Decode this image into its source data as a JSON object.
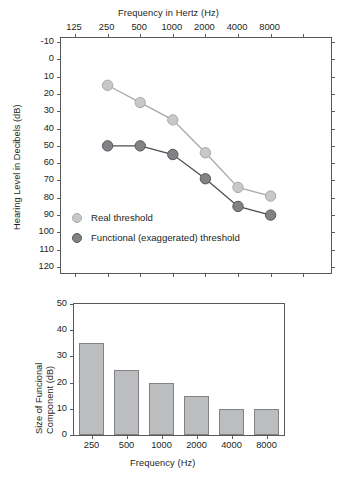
{
  "figure": {
    "panels": [
      "audiogram",
      "functional-component-bars"
    ]
  },
  "colors": {
    "real_threshold": "#c7c8ca",
    "functional_threshold": "#808285",
    "bar_fill": "#bcbdbf",
    "bar_stroke": "#808285",
    "axis": "#58595b",
    "text": "#231f20"
  },
  "audiogram": {
    "top_axis_title": "Frequency in Hertz (Hz)",
    "y_axis_title": "Hearing Level in Decibels (dB)",
    "x_tick_labels": [
      "125",
      "250",
      "500",
      "1000",
      "2000",
      "4000",
      "8000"
    ],
    "y_tick_labels": [
      "-10",
      "0",
      "10",
      "20",
      "30",
      "40",
      "50",
      "60",
      "70",
      "80",
      "90",
      "100",
      "110",
      "120"
    ],
    "legend": [
      {
        "label": "Real threshold",
        "marker": "light-gray-circle"
      },
      {
        "label": "Functional (exaggerated) threshold",
        "marker": "dark-gray-circle"
      }
    ]
  },
  "barchart": {
    "x_axis_title": "Frequency (Hz)",
    "y_axis_title_line1": "Size of Funcional",
    "y_axis_title_line2": "Component (dB)",
    "x_tick_labels": [
      "250",
      "500",
      "1000",
      "2000",
      "4000",
      "8000"
    ],
    "y_tick_labels": [
      "0",
      "10",
      "20",
      "30",
      "40",
      "50"
    ]
  },
  "chart_data": [
    {
      "type": "line",
      "title": "",
      "xlabel": "Frequency in Hertz (Hz)",
      "ylabel": "Hearing Level in Decibels (dB)",
      "x": [
        250,
        500,
        1000,
        2000,
        4000,
        8000
      ],
      "xtick_values": [
        125,
        250,
        500,
        1000,
        2000,
        4000,
        8000
      ],
      "xlabel_position": "top",
      "x_scale": "log",
      "ylim": [
        -10,
        120
      ],
      "y_inverted": true,
      "y_tick_step": 10,
      "grid": false,
      "legend_position": "inside-lower-left",
      "series": [
        {
          "name": "Real threshold",
          "values": [
            15,
            25,
            35,
            54,
            74,
            79
          ],
          "color": "#c7c8ca",
          "marker": "circle"
        },
        {
          "name": "Functional (exaggerated) threshold",
          "values": [
            50,
            50,
            55,
            69,
            85,
            90
          ],
          "color": "#808285",
          "marker": "circle"
        }
      ]
    },
    {
      "type": "bar",
      "title": "",
      "xlabel": "Frequency (Hz)",
      "ylabel": "Size of Funcional Component (dB)",
      "categories": [
        "250",
        "500",
        "1000",
        "2000",
        "4000",
        "8000"
      ],
      "values": [
        35,
        25,
        20,
        15,
        10,
        10
      ],
      "ylim": [
        0,
        50
      ],
      "y_tick_step": 10,
      "grid": false,
      "bar_color": "#bcbdbf"
    }
  ]
}
